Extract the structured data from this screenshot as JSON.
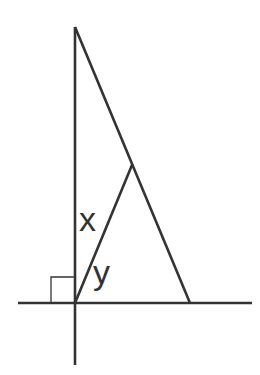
{
  "diagram": {
    "labels": {
      "angle_x": "x",
      "angle_y": "y"
    },
    "colors": {
      "line": "#333333",
      "background": "#ffffff"
    },
    "points": {
      "top_vertex": [
        75,
        27
      ],
      "origin": [
        75,
        303
      ],
      "base_vertex": [
        190,
        303
      ],
      "hypotenuse_point": [
        132,
        165
      ]
    },
    "right_angle_marker": true
  }
}
